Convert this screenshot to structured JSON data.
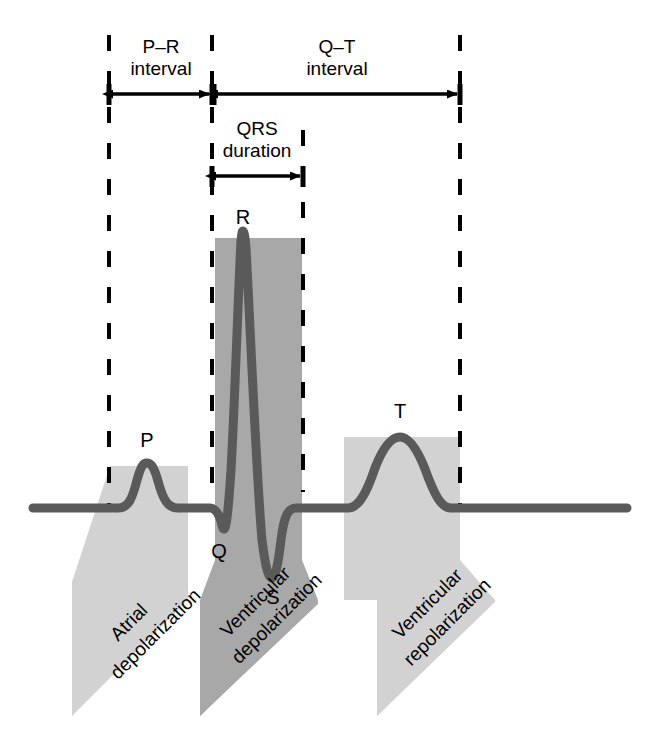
{
  "figure": {
    "background_color": "#ffffff"
  },
  "colors": {
    "trace": "#5a5a5a",
    "band_light": "#d2d2d2",
    "band_dark": "#a8a8a8",
    "dashed_line": "#000000",
    "arrow": "#000000",
    "text": "#000000"
  },
  "intervals": [
    {
      "id": "pr-interval",
      "line1": "P–R",
      "line2": "interval",
      "start_x": 109,
      "end_x": 212,
      "arrow_y": 94
    },
    {
      "id": "qt-interval",
      "line1": "Q–T",
      "line2": "interval",
      "start_x": 214,
      "end_x": 460,
      "arrow_y": 94
    },
    {
      "id": "qrs-duration",
      "line1": "QRS",
      "line2": "duration",
      "start_x": 212,
      "end_x": 303,
      "arrow_y": 176
    }
  ],
  "wave_labels": [
    {
      "id": "p-wave-label",
      "text": "P",
      "x": 147,
      "y": 447
    },
    {
      "id": "r-wave-label",
      "text": "R",
      "x": 243,
      "y": 224
    },
    {
      "id": "q-wave-label",
      "text": "Q",
      "x": 219,
      "y": 558
    },
    {
      "id": "s-wave-label",
      "text": "S",
      "x": 273,
      "y": 604
    },
    {
      "id": "t-wave-label",
      "text": "T",
      "x": 400,
      "y": 418
    }
  ],
  "dashed_lines": [
    {
      "id": "dashed-line-1",
      "x": 109,
      "y_top": 35,
      "y_bottom": 506
    },
    {
      "id": "dashed-line-2",
      "x": 212,
      "y_top": 35,
      "y_bottom": 500
    },
    {
      "id": "dashed-line-3",
      "x": 303,
      "y_top": 130,
      "y_bottom": 492
    },
    {
      "id": "dashed-line-4",
      "x": 460,
      "y_top": 35,
      "y_bottom": 508
    }
  ],
  "event_bands": [
    {
      "id": "atrial-depolarization",
      "line1": "Atrial",
      "line2": "depolarization",
      "shade": "light",
      "top_left_x": 110,
      "top_right_x": 188,
      "top_y": 466,
      "label_x": 120,
      "label_y": 640,
      "rotation": -45
    },
    {
      "id": "ventricular-depolarization",
      "line1": "Ventricular",
      "line2": "depolarization",
      "shade": "dark",
      "top_left_x": 215,
      "top_right_x": 302,
      "top_y": 238,
      "label_x": 232,
      "label_y": 642,
      "rotation": -45
    },
    {
      "id": "ventricular-repolarization",
      "line1": "Ventricular",
      "line2": "repolarization",
      "shade": "light",
      "top_left_x": 344,
      "top_right_x": 460,
      "top_y": 437,
      "label_x": 368,
      "label_y": 646,
      "rotation": -45
    }
  ],
  "trace_geometry": {
    "baseline_y": 508,
    "trace_start_x": 33,
    "trace_end_x": 627,
    "stroke_width": 9,
    "p_peak": {
      "x": 147,
      "y": 463
    },
    "r_peak": {
      "x": 243,
      "y": 231
    },
    "q_trough": {
      "x": 224,
      "y": 529
    },
    "s_trough": {
      "x": 272,
      "y": 578
    },
    "t_peak": {
      "x": 400,
      "y": 437
    }
  }
}
